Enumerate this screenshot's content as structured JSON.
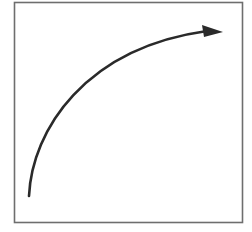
{
  "diagram": {
    "type": "curved-arrow-in-box",
    "frame": {
      "x": 14.5,
      "y": 2.5,
      "width": 228,
      "height": 220,
      "stroke": "#6e6e6e",
      "stroke_width": 1.6,
      "fill": "#ffffff"
    },
    "arrow": {
      "path": "M 29 196 C 32 130, 85 48, 207 31",
      "stroke": "#2a2a2a",
      "stroke_width": 2.6,
      "head_points": "202,25 223,32 204,37",
      "head_fill": "#2a2a2a",
      "direction": "up-right"
    }
  }
}
